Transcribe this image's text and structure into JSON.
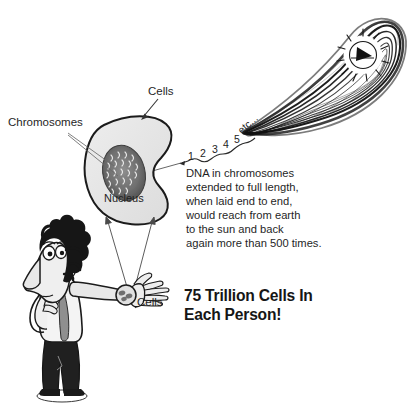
{
  "poster": {
    "title": "75 Trillion Cells In Each Person!",
    "background_color": "#ffffff",
    "ink_color": "#1f1f1f"
  },
  "labels": {
    "cells_top": "Cells",
    "chromosomes": "Chromosomes",
    "nucleus": "Nucleus",
    "cells_arm": "Cells"
  },
  "dna_sequence": {
    "items": [
      "1",
      "2",
      "3",
      "4",
      "5",
      "etc..."
    ]
  },
  "dna_paragraph": {
    "lines": [
      "DNA in chromosomes",
      "extended to full length,",
      "when laid end to end,",
      "would reach from earth",
      "to the sun and back",
      "again more than 500 times."
    ]
  },
  "headline": {
    "line1": "75 Trillion Cells In",
    "line2": "Each Person!"
  },
  "figures": {
    "cell": "kidney-shaped-cell",
    "nucleus": "dark-oval-nucleus-with-chromosomes",
    "dna_loop": "long-black-dna-strand-loop",
    "sun": "radiating-sun-with-wedge",
    "person": "cartoon-man-pointing-arm",
    "magnifier": "wrist-magnifier-circle"
  }
}
